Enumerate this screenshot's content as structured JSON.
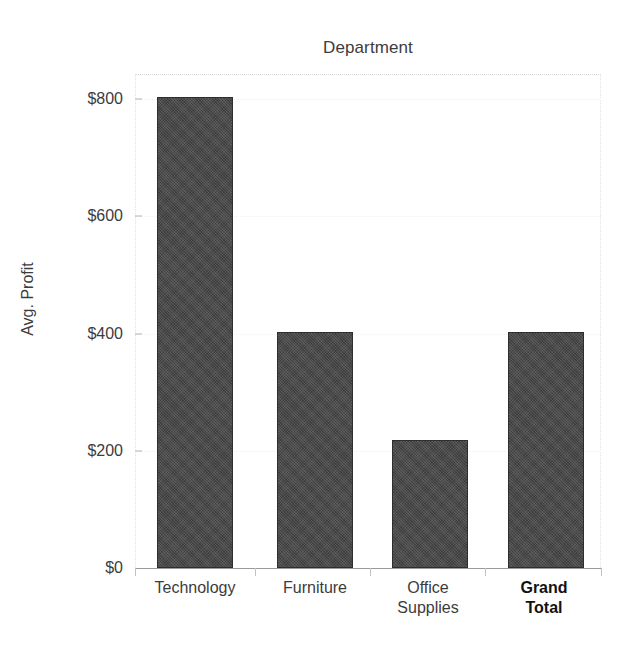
{
  "chart_data": {
    "type": "bar",
    "title": "Department",
    "xlabel": "",
    "ylabel": "Avg. Profit",
    "categories": [
      "Technology",
      "Furniture",
      "Office Supplies",
      "Grand Total"
    ],
    "values": [
      803,
      402,
      219,
      402
    ],
    "ylim": [
      0,
      845
    ],
    "yticks": [
      0,
      200,
      400,
      600,
      800
    ],
    "ytick_labels": [
      "$0",
      "$200",
      "$400",
      "$600",
      "$800"
    ],
    "grid": false,
    "legend": "none",
    "bar_color": "#494949",
    "bar_edge_color": "#2e2e2e",
    "text_color": "#3c3c3c",
    "background_color": "#ffffff"
  },
  "axis": {
    "y_title": "Avg. Profit",
    "ticks": [
      {
        "label": "$800",
        "value": 800
      },
      {
        "label": "$600",
        "value": 600
      },
      {
        "label": "$400",
        "value": 400
      },
      {
        "label": "$200",
        "value": 200
      },
      {
        "label": "$0",
        "value": 0
      }
    ]
  },
  "bars": [
    {
      "label": "Technology",
      "label_line1": "Technology",
      "label_line2": "",
      "value": 803,
      "bold": false
    },
    {
      "label": "Furniture",
      "label_line1": "Furniture",
      "label_line2": "",
      "value": 402,
      "bold": false
    },
    {
      "label": "Office Supplies",
      "label_line1": "Office",
      "label_line2": "Supplies",
      "value": 219,
      "bold": false
    },
    {
      "label": "Grand Total",
      "label_line1": "Grand",
      "label_line2": "Total",
      "value": 402,
      "bold": true
    }
  ]
}
